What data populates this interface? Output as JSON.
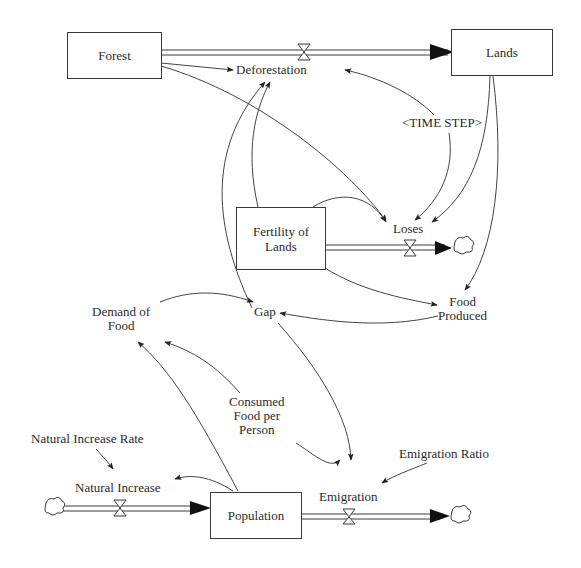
{
  "diagram": {
    "type": "stock-and-flow",
    "stocks": {
      "forest": "Forest",
      "lands": "Lands",
      "fertility_1": "Fertility of",
      "fertility_2": "Lands",
      "population": "Population"
    },
    "flows": {
      "deforestation": "Deforestation",
      "loses": "Loses",
      "natural_increase": "Natural Increase",
      "emigration": "Emigration"
    },
    "variables": {
      "time_step": "<TIME STEP>",
      "food_produced_1": "Food",
      "food_produced_2": "Produced",
      "gap": "Gap",
      "demand_1": "Demand of",
      "demand_2": "Food",
      "consumed_1": "Consumed",
      "consumed_2": "Food per",
      "consumed_3": "Person",
      "natural_increase_rate": "Natural Increase Rate",
      "emigration_ratio": "Emigration Ratio"
    },
    "colors": {
      "line": "#3a3a3a",
      "arrow": "#222222",
      "background": "#ffffff"
    }
  }
}
